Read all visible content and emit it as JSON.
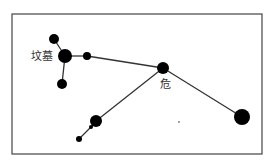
{
  "diagram": {
    "type": "star-chart",
    "frame": {
      "x": 12,
      "y": 14,
      "width": 250,
      "height": 140
    },
    "labels": [
      {
        "id": "tomb",
        "text": "坟墓",
        "x": 31,
        "y": 51
      },
      {
        "id": "wei",
        "text": "危",
        "x": 161,
        "y": 79
      }
    ],
    "stars": [
      {
        "id": "s1",
        "x": 54,
        "y": 39,
        "r": 5
      },
      {
        "id": "s2",
        "x": 65,
        "y": 56,
        "r": 7
      },
      {
        "id": "s3",
        "x": 87,
        "y": 56,
        "r": 4
      },
      {
        "id": "s4",
        "x": 62,
        "y": 84,
        "r": 5
      },
      {
        "id": "s5",
        "x": 163,
        "y": 68,
        "r": 6
      },
      {
        "id": "s6",
        "x": 242,
        "y": 117,
        "r": 8
      },
      {
        "id": "s7",
        "x": 96,
        "y": 121,
        "r": 6
      },
      {
        "id": "s8",
        "x": 91,
        "y": 127,
        "r": 2
      },
      {
        "id": "s9",
        "x": 79,
        "y": 139,
        "r": 3
      },
      {
        "id": "s10",
        "x": 179,
        "y": 122,
        "r": 0.7
      }
    ],
    "lines": [
      [
        "s1",
        "s2"
      ],
      [
        "s2",
        "s3"
      ],
      [
        "s2",
        "s4"
      ],
      [
        "s3",
        "s5"
      ],
      [
        "s5",
        "s6"
      ],
      [
        "s5",
        "s7"
      ],
      [
        "s7",
        "s8"
      ],
      [
        "s8",
        "s9"
      ]
    ],
    "colors": {
      "star": "#000000",
      "line": "#333333",
      "frame": "#444444"
    }
  }
}
